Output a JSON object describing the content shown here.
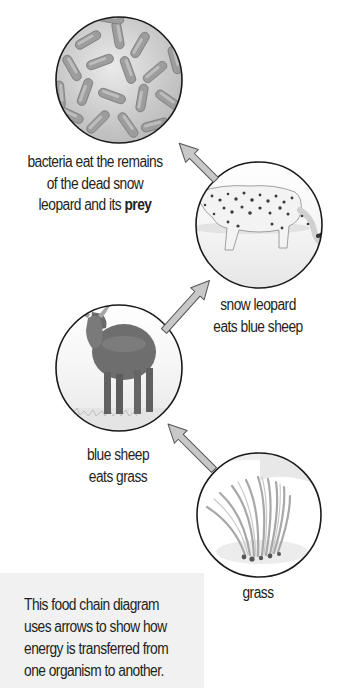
{
  "diagram": {
    "type": "food-chain",
    "nodes": [
      {
        "id": "bacteria",
        "label_lines": [
          "bacteria eat the remains",
          "of the dead snow"
        ],
        "label_last_prefix": "leopard and its ",
        "label_last_bold": "prey",
        "image": "bacteria-icon"
      },
      {
        "id": "snow-leopard",
        "label_lines": [
          "snow leopard",
          "eats blue sheep"
        ],
        "image": "snow-leopard-icon"
      },
      {
        "id": "blue-sheep",
        "label_lines": [
          "blue sheep",
          "eats grass"
        ],
        "image": "blue-sheep-icon"
      },
      {
        "id": "grass",
        "label_lines": [
          "grass"
        ],
        "image": "grass-icon"
      }
    ],
    "arrows": [
      {
        "from": "grass",
        "to": "blue-sheep"
      },
      {
        "from": "blue-sheep",
        "to": "snow-leopard"
      },
      {
        "from": "snow-leopard",
        "to": "bacteria"
      }
    ],
    "caption_lines": [
      "This food chain diagram",
      "uses arrows to show how",
      "energy is transferred from",
      "one organism to another."
    ],
    "colors": {
      "circle_outline": "#1a1a1a",
      "arrow_fill": "#c8c8c8",
      "arrow_stroke": "#555555",
      "caption_bg": "#f1f1f1",
      "text": "#231f20"
    }
  }
}
